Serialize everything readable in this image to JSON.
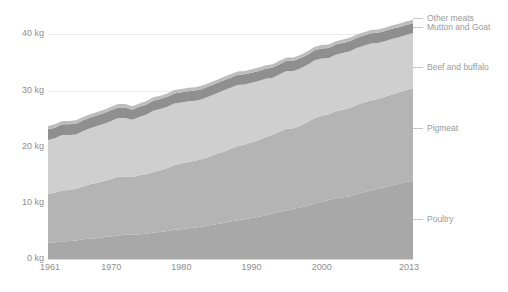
{
  "chart_data": {
    "type": "area",
    "stacked": true,
    "title": "",
    "subtitle": "",
    "xlabel": "",
    "ylabel": "",
    "xlim": [
      1961,
      2013
    ],
    "ylim": [
      0,
      44
    ],
    "grid": true,
    "legend_position": "right",
    "y_unit": "kg",
    "y_ticks": [
      {
        "value": 0,
        "label": "0 kg"
      },
      {
        "value": 10,
        "label": "10 kg"
      },
      {
        "value": 20,
        "label": "20 kg"
      },
      {
        "value": 30,
        "label": "30 kg"
      },
      {
        "value": 40,
        "label": "40 kg"
      }
    ],
    "x_ticks": [
      {
        "value": 1961,
        "label": "1961"
      },
      {
        "value": 1970,
        "label": "1970"
      },
      {
        "value": 1980,
        "label": "1980"
      },
      {
        "value": 1990,
        "label": "1990"
      },
      {
        "value": 2000,
        "label": "2000"
      },
      {
        "value": 2013,
        "label": "2013"
      }
    ],
    "x": [
      1961,
      1962,
      1963,
      1964,
      1965,
      1966,
      1967,
      1968,
      1969,
      1970,
      1971,
      1972,
      1973,
      1974,
      1975,
      1976,
      1977,
      1978,
      1979,
      1980,
      1981,
      1982,
      1983,
      1984,
      1985,
      1986,
      1987,
      1988,
      1989,
      1990,
      1991,
      1992,
      1993,
      1994,
      1995,
      1996,
      1997,
      1998,
      1999,
      2000,
      2001,
      2002,
      2003,
      2004,
      2005,
      2006,
      2007,
      2008,
      2009,
      2010,
      2011,
      2012,
      2013
    ],
    "series": [
      {
        "name": "Poultry",
        "color": "#a8a8a8",
        "values": [
          2.9,
          3.0,
          3.1,
          3.2,
          3.3,
          3.5,
          3.6,
          3.7,
          3.9,
          4.0,
          4.2,
          4.3,
          4.3,
          4.4,
          4.5,
          4.7,
          4.8,
          5.0,
          5.2,
          5.3,
          5.5,
          5.6,
          5.8,
          6.0,
          6.2,
          6.4,
          6.7,
          6.9,
          7.1,
          7.3,
          7.5,
          7.8,
          8.1,
          8.4,
          8.7,
          8.9,
          9.2,
          9.5,
          9.9,
          10.2,
          10.5,
          10.8,
          11.0,
          11.2,
          11.6,
          11.9,
          12.2,
          12.5,
          12.8,
          13.1,
          13.4,
          13.7,
          14.0
        ]
      },
      {
        "name": "Pigmeat",
        "color": "#b4b4b4",
        "values": [
          8.7,
          8.8,
          9.1,
          9.1,
          9.2,
          9.4,
          9.7,
          9.9,
          10.0,
          10.2,
          10.5,
          10.4,
          10.3,
          10.5,
          10.6,
          10.8,
          11.0,
          11.2,
          11.5,
          11.7,
          11.8,
          11.9,
          12.0,
          12.2,
          12.5,
          12.7,
          12.9,
          13.2,
          13.3,
          13.5,
          13.7,
          13.9,
          14.0,
          14.3,
          14.5,
          14.4,
          14.6,
          14.9,
          15.2,
          15.3,
          15.3,
          15.5,
          15.6,
          15.7,
          15.9,
          16.0,
          16.1,
          16.0,
          16.1,
          16.2,
          16.3,
          16.4,
          16.4
        ]
      },
      {
        "name": "Beef and buffalo",
        "color": "#cfcfcf",
        "values": [
          9.6,
          9.7,
          9.9,
          9.8,
          9.7,
          9.9,
          10.0,
          10.1,
          10.2,
          10.4,
          10.4,
          10.4,
          10.2,
          10.4,
          10.6,
          10.9,
          10.9,
          10.9,
          11.0,
          10.9,
          10.8,
          10.7,
          10.7,
          10.8,
          10.8,
          10.9,
          10.9,
          10.9,
          10.7,
          10.6,
          10.5,
          10.4,
          10.2,
          10.2,
          10.3,
          10.2,
          10.2,
          10.2,
          10.3,
          10.2,
          10.0,
          10.1,
          10.1,
          10.1,
          10.1,
          10.1,
          10.1,
          10.0,
          9.9,
          9.9,
          9.8,
          9.8,
          9.8
        ]
      },
      {
        "name": "Mutton and Goat",
        "color": "#8f8f8f",
        "values": [
          1.9,
          1.9,
          1.9,
          1.9,
          1.9,
          1.9,
          1.9,
          1.9,
          1.9,
          1.9,
          1.9,
          1.9,
          1.8,
          1.8,
          1.8,
          1.8,
          1.8,
          1.8,
          1.8,
          1.8,
          1.8,
          1.8,
          1.8,
          1.8,
          1.8,
          1.8,
          1.8,
          1.8,
          1.8,
          1.8,
          1.8,
          1.8,
          1.8,
          1.8,
          1.8,
          1.8,
          1.8,
          1.8,
          1.8,
          1.8,
          1.8,
          1.8,
          1.8,
          1.8,
          1.8,
          1.8,
          1.8,
          1.8,
          1.8,
          1.8,
          1.8,
          1.8,
          1.8
        ]
      },
      {
        "name": "Other meats",
        "color": "#bdbdbd",
        "values": [
          0.6,
          0.6,
          0.6,
          0.6,
          0.6,
          0.6,
          0.6,
          0.6,
          0.6,
          0.6,
          0.6,
          0.6,
          0.6,
          0.6,
          0.6,
          0.6,
          0.6,
          0.6,
          0.6,
          0.6,
          0.6,
          0.6,
          0.6,
          0.6,
          0.6,
          0.6,
          0.6,
          0.6,
          0.6,
          0.6,
          0.6,
          0.6,
          0.6,
          0.6,
          0.6,
          0.6,
          0.6,
          0.6,
          0.6,
          0.6,
          0.6,
          0.6,
          0.6,
          0.6,
          0.6,
          0.6,
          0.6,
          0.6,
          0.6,
          0.6,
          0.6,
          0.6,
          0.6
        ]
      }
    ]
  },
  "legend": {
    "entries": [
      {
        "label": "Other meats",
        "color": "#bdbdbd",
        "y": 13
      },
      {
        "label": "Mutton and Goat",
        "color": "#8f8f8f",
        "y": 22
      },
      {
        "label": "Beef and buffalo",
        "color": "#cfcfcf",
        "y": 62
      },
      {
        "label": "Pigmeat",
        "color": "#b4b4b4",
        "y": 123
      },
      {
        "label": "Poultry",
        "color": "#a8a8a8",
        "y": 214
      }
    ]
  },
  "colors": {
    "background": "#ffffff",
    "gridline": "#ebebeb",
    "axis_line": "#d8d8d8",
    "tick_text": "#8e8e8e",
    "legend_text": "#9a9a9a",
    "legend_leader": "#c6c6c6"
  }
}
